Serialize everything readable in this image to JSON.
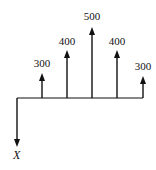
{
  "diagram": {
    "type": "cash-flow-diagram",
    "baseline": {
      "x_start": 17,
      "x_end": 143,
      "y": 98
    },
    "colors": {
      "line": "#111111",
      "background": "#ffffff"
    },
    "inflows": [
      {
        "period": 1,
        "label": "300",
        "value": 300
      },
      {
        "period": 2,
        "label": "400",
        "value": 400
      },
      {
        "period": 3,
        "label": "500",
        "value": 500
      },
      {
        "period": 4,
        "label": "400",
        "value": 400
      },
      {
        "period": 5,
        "label": "300",
        "value": 300
      }
    ],
    "outflow": {
      "period": 0,
      "label": "X"
    }
  }
}
